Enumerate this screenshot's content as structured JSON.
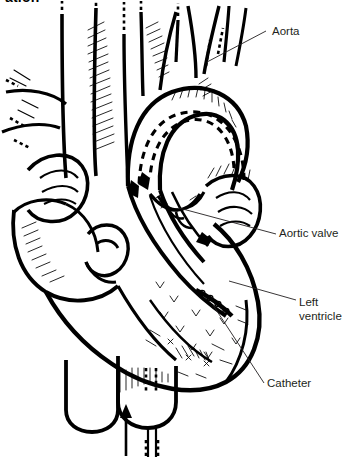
{
  "figure": {
    "kind": "anatomical-line-illustration",
    "heading_cropped": "ation",
    "background_color": "#ffffff",
    "ink_color": "#000000",
    "label_color": "#231f20",
    "width": 344,
    "height": 457
  },
  "labels": [
    {
      "id": "aorta",
      "text": "Aorta",
      "x": 272,
      "y": 25
    },
    {
      "id": "aortic-valve",
      "text": "Aortic valve",
      "x": 279,
      "y": 227
    },
    {
      "id": "left-ventricle",
      "text": "Left\nventricle",
      "x": 299,
      "y": 296
    },
    {
      "id": "catheter",
      "text": "Catheter",
      "x": 267,
      "y": 377
    }
  ],
  "leaders": [
    {
      "id": "aorta-leader",
      "from": [
        266,
        31
      ],
      "to": [
        207,
        62
      ]
    },
    {
      "id": "aortic-valve-leader",
      "from": [
        276,
        234
      ],
      "to": [
        179,
        208
      ]
    },
    {
      "id": "left-ventricle-leader",
      "from": [
        296,
        300
      ],
      "to": [
        229,
        281
      ]
    },
    {
      "id": "catheter-leader",
      "from": [
        264,
        383
      ],
      "to": [
        213,
        305
      ]
    }
  ],
  "annotations": {
    "flow_arrows": [
      {
        "id": "arch-flow-dashed",
        "description": "dashed blood-flow loop through aortic arch",
        "direction": "leftward-down"
      },
      {
        "id": "descending-flow-arrow",
        "description": "solid arrow down the ascending aorta into ventricle",
        "direction": "down-right"
      },
      {
        "id": "catheter-entry-arrow",
        "description": "solid arrow at bottom showing catheter advancing upward",
        "direction": "up"
      }
    ],
    "catheter_tip": {
      "description": "beaded / dotted catheter tip inside the left ventricle"
    }
  }
}
